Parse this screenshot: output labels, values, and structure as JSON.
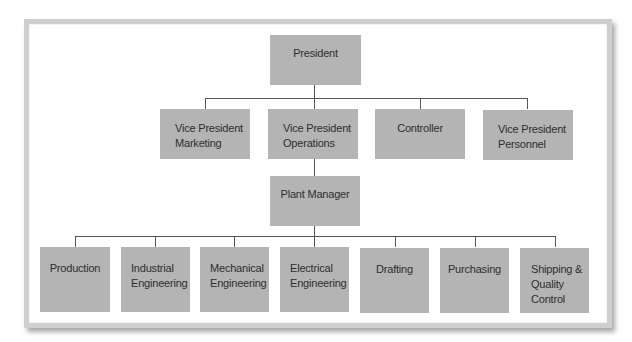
{
  "chart": {
    "title": "",
    "levels": {
      "top": {
        "label": "President"
      },
      "vice": [
        {
          "label_lines": [
            "Vice President",
            "Marketing"
          ]
        },
        {
          "label_lines": [
            "Vice President",
            "Operations"
          ]
        },
        {
          "label_lines": [
            "Controller"
          ]
        },
        {
          "label_lines": [
            "Vice President",
            "Personnel"
          ]
        }
      ],
      "plant": {
        "label": "Plant Manager",
        "reports_to": "Vice President Operations"
      },
      "departments": [
        {
          "label_lines": [
            "Production"
          ]
        },
        {
          "label_lines": [
            "Industrial",
            "Engineering"
          ]
        },
        {
          "label_lines": [
            "Mechanical",
            "Engineering"
          ]
        },
        {
          "label_lines": [
            "Electrical",
            "Engineering"
          ]
        },
        {
          "label_lines": [
            "Drafting"
          ]
        },
        {
          "label_lines": [
            "Purchasing"
          ]
        },
        {
          "label_lines": [
            "Shipping &",
            "Quality",
            "Control"
          ]
        }
      ]
    },
    "colors": {
      "box": "#b4b4b4",
      "text": "#2e2e2e",
      "connector": "#555555",
      "frame": "#cfcfcf"
    }
  }
}
